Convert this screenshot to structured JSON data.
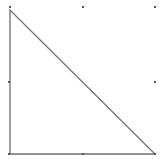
{
  "canvas": {
    "width": 161,
    "height": 159,
    "background": "#ffffff"
  },
  "shape": {
    "type": "right-triangle",
    "stroke": "#6e6e6e",
    "stroke_width": 1.3,
    "fill": "none",
    "vertices": [
      {
        "x": 10,
        "y": 10
      },
      {
        "x": 10,
        "y": 154
      },
      {
        "x": 155,
        "y": 154
      }
    ]
  },
  "selection_handles": {
    "color": "#555555",
    "size": 2,
    "points": [
      {
        "name": "top-left",
        "x": 10,
        "y": 7
      },
      {
        "name": "top-middle",
        "x": 83,
        "y": 7
      },
      {
        "name": "top-right",
        "x": 155,
        "y": 7
      },
      {
        "name": "middle-left",
        "x": 9,
        "y": 82
      },
      {
        "name": "middle-right",
        "x": 155,
        "y": 82
      },
      {
        "name": "bottom-left",
        "x": 9,
        "y": 154
      },
      {
        "name": "bottom-middle",
        "x": 83,
        "y": 154
      },
      {
        "name": "bottom-right",
        "x": 155,
        "y": 154
      }
    ]
  }
}
